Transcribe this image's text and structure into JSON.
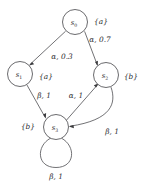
{
  "figure": {
    "kind": "state-transition-diagram",
    "background_color": "#ffffff",
    "stroke_color": "#59595c",
    "text_color": "#2e2e31"
  },
  "nodes": [
    {
      "id": "s0",
      "label": "s",
      "sub": "0",
      "cx": 75,
      "cy": 22,
      "r": 12.5,
      "ap": "{a}",
      "ap_x": 101,
      "ap_y": 21
    },
    {
      "id": "s1",
      "label": "s",
      "sub": "1",
      "cx": 20,
      "cy": 74,
      "r": 12.5,
      "ap": "{a}",
      "ap_x": 46,
      "ap_y": 76
    },
    {
      "id": "s2",
      "label": "s",
      "sub": "2",
      "cx": 106,
      "cy": 75,
      "r": 12.5,
      "ap": "{b}",
      "ap_x": 131,
      "ap_y": 76
    },
    {
      "id": "s3",
      "label": "s",
      "sub": "3",
      "cx": 56,
      "cy": 127,
      "r": 12.5,
      "ap": "{b}",
      "ap_x": 28,
      "ap_y": 126
    }
  ],
  "edges": [
    {
      "id": "e-s0-s1",
      "from": "s0",
      "to": "s1",
      "action": "α",
      "probability": "0.3",
      "label": "α, 0.3",
      "label_x": 62,
      "label_y": 56
    },
    {
      "id": "e-s0-s2",
      "from": "s0",
      "to": "s2",
      "action": "α",
      "probability": "0.7",
      "label": "α, 0.7",
      "label_x": 100,
      "label_y": 39
    },
    {
      "id": "e-s1-s3",
      "from": "s1",
      "to": "s3",
      "action": "β",
      "probability": "1",
      "label": "β, 1",
      "label_x": 44,
      "label_y": 95
    },
    {
      "id": "e-s3-s2",
      "from": "s3",
      "to": "s2",
      "action": "α",
      "probability": "1",
      "label": "α, 1",
      "label_x": 76,
      "label_y": 95
    },
    {
      "id": "e-s2-s3",
      "from": "s2",
      "to": "s3",
      "action": "β",
      "probability": "1",
      "label": "β, 1",
      "label_x": 112,
      "label_y": 131
    },
    {
      "id": "e-s3-s3",
      "from": "s3",
      "to": "s3",
      "action": "β",
      "probability": "1",
      "label": "β, 1",
      "label_x": 56,
      "label_y": 176
    }
  ]
}
